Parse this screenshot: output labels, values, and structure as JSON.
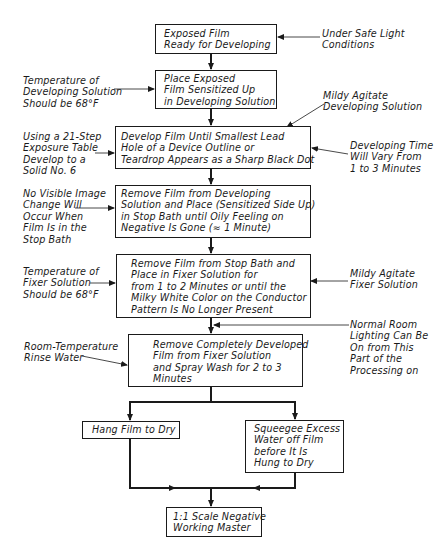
{
  "diagram": {
    "type": "flowchart",
    "title": "",
    "steps": [
      {
        "id": "s1",
        "lines": "Exposed Film\nReady for Developing"
      },
      {
        "id": "s2",
        "lines": "Place Exposed\nFilm Sensitized Up\nin Developing Solution"
      },
      {
        "id": "s3",
        "lines": "Develop Film Until Smallest Lead\nHole of a Device Outline or\nTeardrop Appears as a Sharp Black Dot"
      },
      {
        "id": "s4",
        "lines": "Remove Film from Developing\nSolution and Place (Sensitized Side Up)\nin Stop Bath until Oily Feeling on\nNegative Is Gone (≈ 1 Minute)"
      },
      {
        "id": "s5",
        "lines": "Remove Film from Stop Bath and\nPlace in Fixer Solution for\nfrom 1 to 2 Minutes or until the\nMilky White Color on the Conductor\nPattern Is No Longer Present"
      },
      {
        "id": "s6",
        "lines": "Remove Completely Developed\nFilm from Fixer Solution\nand Spray Wash for 2 to 3\nMinutes"
      },
      {
        "id": "s7a",
        "lines": "Hang Film to Dry"
      },
      {
        "id": "s7b",
        "lines": "Squeegee Excess\nWater off Film\nbefore It Is\nHung to Dry"
      },
      {
        "id": "s8",
        "lines": "1:1 Scale Negative\nWorking Master"
      }
    ],
    "notes": [
      {
        "id": "n1",
        "target": "s1",
        "side": "right",
        "lines": "Under Safe Light\nConditions"
      },
      {
        "id": "n2",
        "target": "s2",
        "side": "left",
        "lines": "Temperature of\nDeveloping Solution\nShould be 68°F"
      },
      {
        "id": "n3",
        "target": "s3",
        "side": "right-top",
        "lines": "Mildy Agitate\nDeveloping Solution"
      },
      {
        "id": "n4",
        "target": "s3",
        "side": "left",
        "lines": "Using a 21-Step\nExposure Table\nDevelop to a\nSolid No. 6"
      },
      {
        "id": "n5",
        "target": "s3",
        "side": "right",
        "lines": "Developing Time\nWill Vary From\n1 to 3 Minutes"
      },
      {
        "id": "n6",
        "target": "s4",
        "side": "left",
        "lines": "No Visible Image\nChange Will\nOccur When\nFilm Is in the\nStop Bath"
      },
      {
        "id": "n7",
        "target": "s5",
        "side": "left",
        "lines": "Temperature of\nFixer Solution\nShould be 68°F"
      },
      {
        "id": "n8",
        "target": "s5",
        "side": "right",
        "lines": "Mildy Agitate\nFixer Solution"
      },
      {
        "id": "n9",
        "target": "s5-s6 connector",
        "side": "right",
        "lines": "Normal Room\nLighting Can Be\nOn from This\nPart of the\nProcessing on"
      },
      {
        "id": "n10",
        "target": "s6",
        "side": "left",
        "lines": "Room-Temperature\nRinse Water"
      }
    ],
    "edges": [
      [
        "s1",
        "s2"
      ],
      [
        "s2",
        "s3"
      ],
      [
        "s3",
        "s4"
      ],
      [
        "s4",
        "s5"
      ],
      [
        "s5",
        "s6"
      ],
      [
        "s6",
        "s7a"
      ],
      [
        "s6",
        "s7b"
      ],
      [
        "s7a",
        "s8"
      ],
      [
        "s7b",
        "s8"
      ]
    ],
    "colors": {
      "ink": "#1a1a1a",
      "background": "#ffffff"
    }
  }
}
